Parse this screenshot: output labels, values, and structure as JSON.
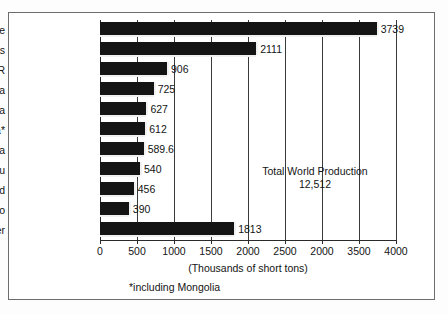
{
  "chart_data": {
    "type": "bar",
    "orientation": "horizontal",
    "title": "",
    "xlabel": "(Thousands of short tons)",
    "ylabel": "",
    "xlim": [
      0,
      4000
    ],
    "grid": true,
    "legend": null,
    "categories": [
      "Chile",
      "United States",
      "former USSR",
      "Canada",
      "Australia",
      "China*",
      "Indonesia",
      "Peru",
      "Poland",
      "Mexico",
      "Other"
    ],
    "values": [
      3739,
      2111,
      906,
      725,
      627,
      612,
      589.6,
      540,
      456,
      390,
      1813
    ],
    "value_labels": [
      "3739",
      "2111",
      "906",
      "725",
      "627",
      "612",
      "589.6",
      "540",
      "456",
      "390",
      "1813"
    ],
    "xticks": [
      0,
      500,
      1000,
      1500,
      2000,
      2500,
      3000,
      3500,
      4000
    ],
    "xtick_labels": [
      "0",
      "500",
      "1000",
      "1500",
      "2000",
      "2500",
      "2000",
      "3500",
      "4000"
    ],
    "annotations": [
      "Total World Production",
      "12,512"
    ],
    "footnote": "*including Mongolia",
    "colors": {
      "bar": "#141414",
      "gridline": "#3a3a3a",
      "axis": "#2a2a2a",
      "frame": "#6d6d6d",
      "background": "#ffffff",
      "text": "#141414"
    }
  }
}
